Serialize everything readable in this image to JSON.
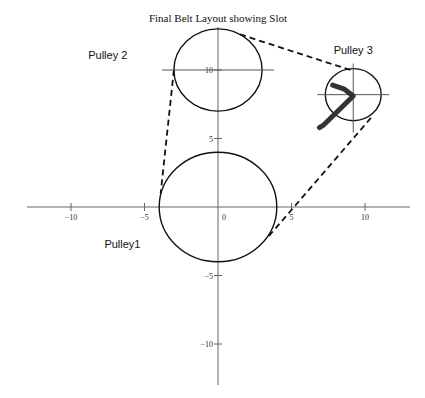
{
  "chart_data": {
    "type": "diagram",
    "title": "Final Belt  Layout showing Slot",
    "xlim": [
      -13,
      13
    ],
    "ylim": [
      -13,
      15
    ],
    "x_ticks": [
      -10,
      -5,
      0,
      5,
      10
    ],
    "y_ticks": [
      -10,
      -5,
      5,
      10
    ],
    "x_tick_labels": [
      "−10",
      "−5",
      "0",
      "5",
      "10"
    ],
    "y_tick_labels": [
      "−10",
      "−5",
      "5",
      "10"
    ],
    "grid": false,
    "pulleys": [
      {
        "name": "Pulley1",
        "label": "Pulley1",
        "cx": 0,
        "cy": 0,
        "r": 4,
        "label_at": [
          -6.5,
          -3
        ]
      },
      {
        "name": "Pulley 2",
        "label": "Pulley 2",
        "cx": 0,
        "cy": 10,
        "r": 3,
        "label_at": [
          -7.5,
          10.8
        ]
      },
      {
        "name": "Pulley 3",
        "label": "Pulley 3",
        "cx": 9.2,
        "cy": 8.2,
        "r": 1.9,
        "label_at": [
          9.2,
          11.2
        ]
      }
    ],
    "belt_segments": [
      {
        "from": [
          -3.0,
          10.0
        ],
        "to": [
          -3.9,
          1.0
        ]
      },
      {
        "from": [
          1.5,
          12.6
        ],
        "to": [
          9.0,
          10.0
        ]
      },
      {
        "from": [
          10.4,
          6.5
        ],
        "to": [
          3.4,
          -2.2
        ]
      }
    ],
    "slot": {
      "points": [
        [
          7.8,
          8.9
        ],
        [
          8.6,
          8.6
        ],
        [
          9.2,
          8.1
        ],
        [
          7.2,
          6.0
        ],
        [
          6.9,
          5.8
        ]
      ]
    }
  }
}
